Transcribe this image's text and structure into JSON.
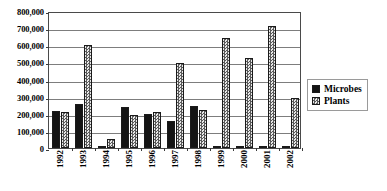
{
  "chart_data": {
    "type": "bar",
    "title": "",
    "subtitle": "",
    "xlabel": "",
    "ylabel": "",
    "categories": [
      "1992",
      "1993",
      "1994",
      "1995",
      "1996",
      "1997",
      "1998",
      "1999",
      "2000",
      "2001",
      "2002"
    ],
    "series": [
      {
        "name": "Microbes",
        "values": [
          218000,
          255000,
          5000,
          238000,
          200000,
          155000,
          248000,
          3000,
          3000,
          3000,
          2000
        ]
      },
      {
        "name": "Plants",
        "values": [
          208000,
          600000,
          55000,
          195000,
          212000,
          495000,
          222000,
          645000,
          525000,
          715000,
          290000
        ]
      }
    ],
    "ylim": [
      0,
      800000
    ],
    "ytick_values": [
      0,
      100000,
      200000,
      300000,
      400000,
      500000,
      600000,
      700000,
      800000
    ],
    "ytick_labels": [
      "0",
      "100,000",
      "200,000",
      "300,000",
      "400,000",
      "500,000",
      "600,000",
      "700,000",
      "800,000"
    ],
    "grid": true,
    "legend_position": "right",
    "colors": {
      "microbes": "#141414",
      "plants": "#bdbdbd",
      "gridline": "#7d7d7d",
      "frame": "#4a4a4a",
      "text": "#000000",
      "background": "#ffffff"
    }
  },
  "legend": {
    "entries": [
      {
        "label": "Microbes",
        "swatch": "solid-black-square-icon"
      },
      {
        "label": "Plants",
        "swatch": "checkered-square-icon"
      }
    ]
  }
}
